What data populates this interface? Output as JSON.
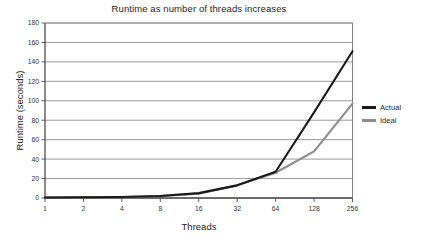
{
  "chart_data": {
    "type": "line",
    "title": "Runtime as number of threads increases",
    "xlabel": "Threads",
    "ylabel": "Runtime (seconds)",
    "categories": [
      "1",
      "2",
      "4",
      "8",
      "16",
      "32",
      "64",
      "128",
      "256"
    ],
    "x_tick_labels": [
      "1",
      "2",
      "4",
      "8",
      "16",
      "32",
      "64",
      "128",
      "256"
    ],
    "y_tick_labels": [
      "0",
      "20",
      "40",
      "60",
      "80",
      "100",
      "120",
      "140",
      "160",
      "180"
    ],
    "ylim": [
      0,
      180
    ],
    "y_ticks": [
      0,
      20,
      40,
      60,
      80,
      100,
      120,
      140,
      160,
      180
    ],
    "grid": "horizontal",
    "legend_position": "right",
    "series": [
      {
        "name": "Actual",
        "color": "#1a1a1a",
        "values": [
          0.5,
          0.7,
          1,
          2,
          5,
          13,
          27,
          88,
          151
        ]
      },
      {
        "name": "Ideal",
        "color": "#8c8c8c",
        "values": [
          0.5,
          0.7,
          1,
          2,
          4.5,
          13,
          26,
          48,
          97
        ]
      }
    ]
  },
  "legend": {
    "items": [
      {
        "label": "Actual",
        "color": "#1a1a1a"
      },
      {
        "label": "Ideal",
        "color": "#8c8c8c"
      }
    ]
  },
  "colors": {
    "axis": "#4d4d4d",
    "grid": "#808080",
    "background": "#ffffff",
    "text": "#262626"
  }
}
